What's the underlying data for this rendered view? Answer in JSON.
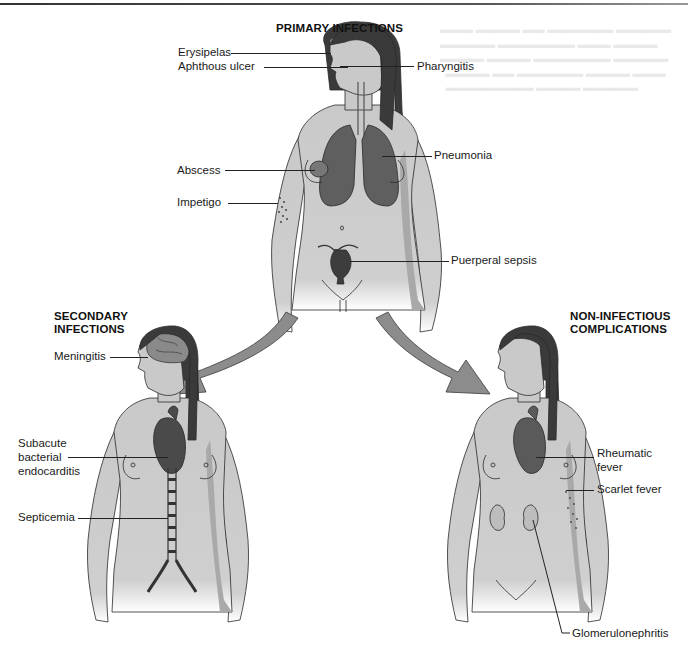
{
  "figure": {
    "type": "anatomical-diagram",
    "colors": {
      "skin": "#c9c9c9",
      "skin_shadow": "#a9a9a9",
      "hair": "#3a3a3a",
      "organ": "#5f5f5f",
      "organ_dark": "#3d3d3d",
      "arrow": "#8c8c8c",
      "outline": "#2a2a2a"
    },
    "primary": {
      "title": "PRIMARY INFECTIONS",
      "labels": {
        "erysipelas": "Erysipelas",
        "aphthous_ulcer": "Aphthous ulcer",
        "pharyngitis": "Pharyngitis",
        "pneumonia": "Pneumonia",
        "abscess": "Abscess",
        "impetigo": "Impetigo",
        "puerperal_sepsis": "Puerperal sepsis"
      }
    },
    "secondary": {
      "title_line1": "SECONDARY",
      "title_line2": "INFECTIONS",
      "labels": {
        "meningitis": "Meningitis",
        "sbe_line1": "Subacute",
        "sbe_line2": "bacterial",
        "sbe_line3": "endocarditis",
        "septicemia": "Septicemia"
      }
    },
    "non_infectious": {
      "title_line1": "NON-INFECTIOUS",
      "title_line2": "COMPLICATIONS",
      "labels": {
        "rheumatic_line1": "Rheumatic",
        "rheumatic_line2": "fever",
        "scarlet_fever": "Scarlet fever",
        "glomerulonephritis": "Glomerulonephritis"
      }
    }
  }
}
